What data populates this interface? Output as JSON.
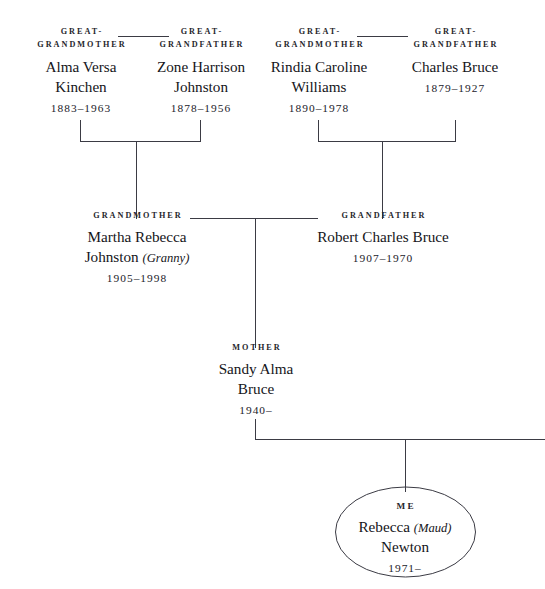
{
  "diagram": {
    "type": "family-tree",
    "title_visible": false,
    "line_color": "#3b3b44",
    "background": "#ffffff",
    "text_color": "#15151a"
  },
  "people": {
    "ggm_left": {
      "role_line1": "GREAT-",
      "role_line2": "GRANDMOTHER",
      "name_line1": "Alma Versa",
      "name_line2": "Kinchen",
      "dates": "1883–1963"
    },
    "ggf_left": {
      "role_line1": "GREAT-",
      "role_line2": "GRANDFATHER",
      "name_line1": "Zone Harrison",
      "name_line2": "Johnston",
      "dates": "1878–1956"
    },
    "ggm_right": {
      "role_line1": "GREAT-",
      "role_line2": "GRANDMOTHER",
      "name_line1": "Rindia Caroline",
      "name_line2": "Williams",
      "dates": "1890–1978"
    },
    "ggf_right": {
      "role_line1": "GREAT-",
      "role_line2": "GRANDFATHER",
      "name_line1": "Charles Bruce",
      "name_line2": "",
      "dates": "1879–1927"
    },
    "grandmother": {
      "role": "GRANDMOTHER",
      "name_line1": "Martha Rebecca",
      "name_line2": "Johnston",
      "nickname": "(Granny)",
      "dates": "1905–1998"
    },
    "grandfather": {
      "role": "GRANDFATHER",
      "name_line1": "Robert Charles Bruce",
      "name_line2": "",
      "dates": "1907–1970"
    },
    "mother": {
      "role": "MOTHER",
      "name_line1": "Sandy Alma",
      "name_line2": "Bruce",
      "dates": "1940–"
    },
    "me": {
      "role": "ME",
      "name_line1": "Rebecca",
      "nickname": "(Maud)",
      "name_line2": "Newton",
      "dates": "1971–"
    }
  }
}
